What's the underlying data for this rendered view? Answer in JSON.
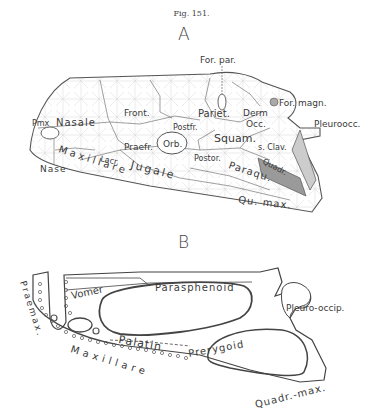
{
  "figure": {
    "caption": "Fig. 151.",
    "panels": [
      {
        "letter": "A",
        "labels": {
          "for_par": "For. par.",
          "pmx": "Pmx",
          "nasale": "Nasale",
          "front": "Front.",
          "pariet": "Pariet.",
          "derm": "Derm",
          "occ": "Occ.",
          "for_magn": "For. magn.",
          "pleuroocc": "Pleuroocc.",
          "postfr": "Postfr.",
          "orb": "Orb.",
          "squam": "Squam.",
          "s_clav": "s. Clav.",
          "praefr": "Praefr.",
          "postor": "Postor.",
          "lacr": "Lacr.",
          "jugale": "Jugale",
          "paraqu": "Paraqu.",
          "quadr": "Quadr.",
          "maxillare": "Maxillare",
          "qu_max": "Qu. max.",
          "nase": "Nase"
        }
      },
      {
        "letter": "B",
        "labels": {
          "parasphenoid": "Parasphenoid",
          "vomer": "Vomer",
          "praemax": "Praemax.",
          "pleuro": "Pleuro-",
          "occip": "occip.",
          "palatin": "Palatin",
          "pterygoid": "Prerygoid",
          "maxillare": "Maxillare",
          "quadr_max": "Quadr.-max."
        }
      }
    ]
  }
}
